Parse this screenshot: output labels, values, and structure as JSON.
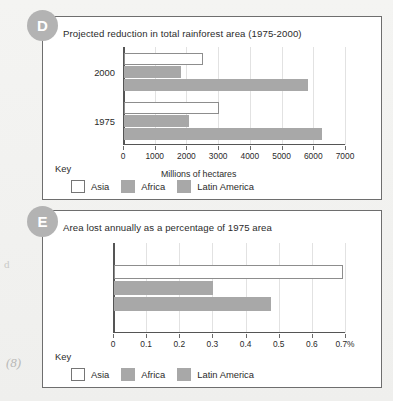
{
  "page": {
    "margin_note": "d",
    "marks": "(8)"
  },
  "panels": [
    {
      "badge": "D",
      "title": "Projected reduction in total rainforest area (1975-2000)",
      "axis_title": "Millions of hectares",
      "key_word": "Key"
    },
    {
      "badge": "E",
      "title": "Area lost annually as a percentage of 1975 area",
      "axis_title": "",
      "key_word": "Key"
    }
  ],
  "legend": {
    "items": [
      {
        "label": "Asia",
        "color": "#ffffff"
      },
      {
        "label": "Africa",
        "color": "#a8a8a8"
      },
      {
        "label": "Latin America",
        "color": "#a8a8a8"
      }
    ]
  },
  "chart_data": [
    {
      "type": "bar",
      "orientation": "horizontal",
      "title": "Projected reduction in total rainforest area (1975-2000)",
      "panel": "D",
      "xlabel": "Millions of hectares",
      "ylabel": "",
      "xlim": [
        0,
        7000
      ],
      "xticks": [
        0,
        1000,
        2000,
        3000,
        4000,
        5000,
        6000,
        7000
      ],
      "xticklabels": [
        "0",
        "1000",
        "2000",
        "3000",
        "4000",
        "5000",
        "6000",
        "7000"
      ],
      "categories": [
        "2000",
        "1975"
      ],
      "grid": true,
      "legend_position": "below-left",
      "series": [
        {
          "name": "Asia",
          "values": [
            2500,
            3000
          ]
        },
        {
          "name": "Africa",
          "values": [
            1800,
            2050
          ]
        },
        {
          "name": "Latin America",
          "values": [
            5800,
            6250
          ]
        }
      ]
    },
    {
      "type": "bar",
      "orientation": "horizontal",
      "title": "Area lost annually as a percentage of 1975 area",
      "panel": "E",
      "xlabel": "",
      "ylabel": "",
      "xlim": [
        0,
        0.7
      ],
      "xticks": [
        0,
        0.1,
        0.2,
        0.3,
        0.4,
        0.5,
        0.6,
        0.7
      ],
      "xticklabels": [
        "0",
        "0.1",
        "0.2",
        "0.3",
        "0.4",
        "0.5",
        "0.6",
        "0.7%"
      ],
      "categories": [
        ""
      ],
      "grid": true,
      "legend_position": "below-left",
      "series": [
        {
          "name": "Asia",
          "values": [
            0.69
          ]
        },
        {
          "name": "Africa",
          "values": [
            0.3
          ]
        },
        {
          "name": "Latin America",
          "values": [
            0.475
          ]
        }
      ]
    }
  ]
}
